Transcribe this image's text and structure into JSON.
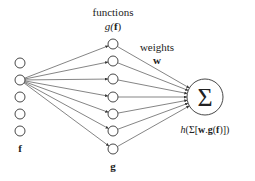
{
  "diagram": {
    "type": "neural-network-schematic",
    "colors": {
      "stroke": "#333333",
      "text": "#222222",
      "background": "#ffffff"
    },
    "input_layer": {
      "label": "f",
      "node_count": 5,
      "nodes": [
        {
          "x": 20,
          "y": 63
        },
        {
          "x": 20,
          "y": 80
        },
        {
          "x": 20,
          "y": 97
        },
        {
          "x": 20,
          "y": 114
        },
        {
          "x": 20,
          "y": 131
        }
      ],
      "source_node_index": 1
    },
    "function_layer": {
      "title": "functions",
      "subtitle_prefix": "g(",
      "subtitle_bold": "f",
      "subtitle_suffix": ")",
      "label": "g",
      "node_count": 7,
      "nodes": [
        {
          "x": 113,
          "y": 44
        },
        {
          "x": 113,
          "y": 61
        },
        {
          "x": 113,
          "y": 79
        },
        {
          "x": 113,
          "y": 97
        },
        {
          "x": 113,
          "y": 114
        },
        {
          "x": 113,
          "y": 131
        },
        {
          "x": 113,
          "y": 149
        }
      ]
    },
    "weights": {
      "title": "weights",
      "symbol": "w"
    },
    "output_node": {
      "symbol": "Σ",
      "x": 205,
      "y": 97,
      "r": 18,
      "formula_prefix": "h",
      "formula_mid1": "(Σ[",
      "formula_w": "w",
      "formula_dot": ".",
      "formula_g": "g",
      "formula_open": "(",
      "formula_f": "f",
      "formula_close": ")])"
    }
  }
}
